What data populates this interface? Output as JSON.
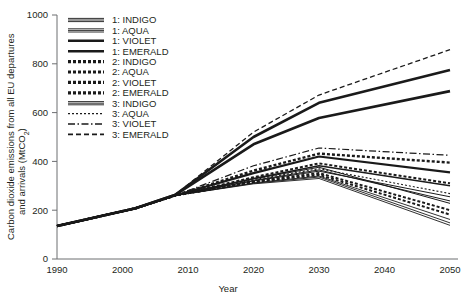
{
  "chart_data": {
    "type": "line",
    "title": "",
    "xlabel": "Year",
    "ylabel": "Carbon dioxide emissions from all EU departures and arrivals (MtCO2)",
    "ylabel_line1": "Carbon dioxide emissions from all EU departures",
    "ylabel_line2_pre": "and arrivals (MtCO",
    "ylabel_line2_sub": "2",
    "ylabel_line2_post": ")",
    "xlim": [
      1990,
      2050
    ],
    "ylim": [
      0,
      1000
    ],
    "xticks": [
      1990,
      2000,
      2010,
      2020,
      2030,
      2040,
      2050
    ],
    "yticks": [
      0,
      200,
      400,
      600,
      800,
      1000
    ],
    "grid": false,
    "legend_position": "top-left-inside",
    "x": [
      1990,
      2002,
      2008,
      2020,
      2030,
      2050
    ],
    "series": [
      {
        "name": "1: INDIGO",
        "label": "1: INDIGO",
        "values": [
          135,
          208,
          260,
          320,
          360,
          255
        ],
        "style": "solid",
        "width": 1.0,
        "dash": ""
      },
      {
        "name": "1: AQUA",
        "label": "1: AQUA",
        "values": [
          135,
          208,
          260,
          322,
          365,
          238
        ],
        "style": "solid",
        "width": 1.0,
        "dash": ""
      },
      {
        "name": "1: VIOLET",
        "label": "1: VIOLET",
        "values": [
          135,
          208,
          260,
          330,
          382,
          300
        ],
        "style": "solid",
        "width": 1.6,
        "dash": ""
      },
      {
        "name": "1: EMERALD",
        "label": "1: EMERALD",
        "values": [
          135,
          208,
          260,
          352,
          420,
          355
        ],
        "style": "solid",
        "width": 2.2,
        "dash": ""
      },
      {
        "name": "2: INDIGO",
        "label": "2: INDIGO",
        "values": [
          135,
          208,
          260,
          318,
          352,
          200
        ],
        "style": "dotted-thick",
        "width": 2.0,
        "dash": "3,2"
      },
      {
        "name": "2: AQUA",
        "label": "2: AQUA",
        "values": [
          135,
          208,
          260,
          315,
          345,
          182
        ],
        "style": "dotted-thick",
        "width": 2.0,
        "dash": "3,2"
      },
      {
        "name": "2: VIOLET",
        "label": "2: VIOLET",
        "values": [
          135,
          208,
          260,
          335,
          392,
          310
        ],
        "style": "dotted-thick",
        "width": 2.0,
        "dash": "3,2"
      },
      {
        "name": "2: EMERALD",
        "label": "2: EMERALD",
        "values": [
          135,
          208,
          260,
          362,
          432,
          395
        ],
        "style": "dotted-thick",
        "width": 2.4,
        "dash": "3,2"
      },
      {
        "name": "3: INDIGO",
        "label": "3: INDIGO",
        "values": [
          135,
          208,
          260,
          312,
          340,
          162
        ],
        "style": "solid",
        "width": 0.9,
        "dash": ""
      },
      {
        "name": "3: AQUA",
        "label": "3: AQUA",
        "values": [
          135,
          208,
          260,
          325,
          370,
          268
        ],
        "style": "dotted",
        "width": 1.1,
        "dash": "2,2"
      },
      {
        "name": "3: VIOLET",
        "label": "3: VIOLET",
        "values": [
          135,
          208,
          260,
          382,
          455,
          425
        ],
        "style": "dashdot",
        "width": 1.2,
        "dash": "7,2.5,1.5,2.5"
      },
      {
        "name": "3: EMERALD",
        "label": "3: EMERALD",
        "values": [
          135,
          208,
          262,
          520,
          672,
          858
        ],
        "style": "dashed",
        "width": 1.3,
        "dash": "5,3"
      }
    ],
    "extra_series": [
      {
        "name": "thick-upper-1",
        "values": [
          135,
          208,
          262,
          500,
          640,
          775
        ],
        "style": "solid",
        "width": 2.6,
        "dash": ""
      },
      {
        "name": "thick-upper-2",
        "values": [
          135,
          208,
          262,
          470,
          578,
          688
        ],
        "style": "solid",
        "width": 2.6,
        "dash": ""
      },
      {
        "name": "lower-extra-1",
        "values": [
          135,
          208,
          260,
          310,
          336,
          148
        ],
        "style": "solid",
        "width": 0.9,
        "dash": ""
      },
      {
        "name": "lower-extra-2",
        "values": [
          135,
          208,
          260,
          308,
          330,
          138
        ],
        "style": "solid",
        "width": 0.9,
        "dash": ""
      },
      {
        "name": "lower-extra-3",
        "values": [
          135,
          208,
          260,
          328,
          376,
          228
        ],
        "style": "solid",
        "width": 1.0,
        "dash": ""
      }
    ]
  },
  "legend": {
    "items": [
      {
        "label": "1: INDIGO"
      },
      {
        "label": "1: AQUA"
      },
      {
        "label": "1: VIOLET"
      },
      {
        "label": "1: EMERALD"
      },
      {
        "label": "2: INDIGO"
      },
      {
        "label": "2: AQUA"
      },
      {
        "label": "2: VIOLET"
      },
      {
        "label": "2: EMERALD"
      },
      {
        "label": "3: INDIGO"
      },
      {
        "label": "3: AQUA"
      },
      {
        "label": "3: VIOLET"
      },
      {
        "label": "3: EMERALD"
      }
    ]
  },
  "axes": {
    "x_title": "Year",
    "x_tick_labels": [
      "1990",
      "2000",
      "2010",
      "2020",
      "2030",
      "2040",
      "2050"
    ],
    "y_tick_labels": [
      "0",
      "200",
      "400",
      "600",
      "800",
      "1000"
    ]
  },
  "colors": {
    "line": "#1a1a1a",
    "axis": "#6d6e71",
    "text": "#231f20",
    "background": "#ffffff"
  }
}
